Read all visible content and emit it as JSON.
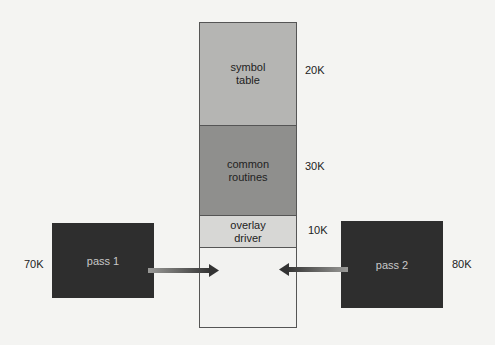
{
  "memory": {
    "segments": [
      {
        "label_line1": "symbol",
        "label_line2": "table",
        "size": "20K"
      },
      {
        "label_line1": "common",
        "label_line2": "routines",
        "size": "30K"
      },
      {
        "label_line1": "overlay",
        "label_line2": "driver",
        "size": "10K"
      },
      {
        "label_line1": "",
        "label_line2": "",
        "size": ""
      }
    ]
  },
  "passes": [
    {
      "label": "pass 1",
      "size": "70K"
    },
    {
      "label": "pass 2",
      "size": "80K"
    }
  ]
}
